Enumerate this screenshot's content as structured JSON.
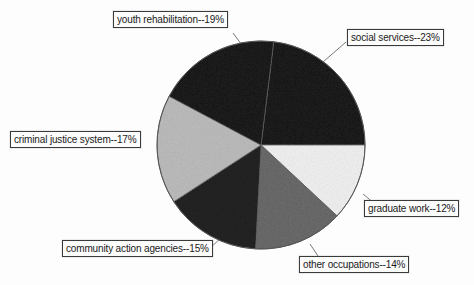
{
  "chart_data": {
    "type": "pie",
    "title": "",
    "subtitle": "",
    "xlabel": "",
    "ylabel": "",
    "legend_position": "callout-labels",
    "grid": false,
    "units": "percent",
    "total": 100,
    "categories": [
      "social services",
      "graduate work",
      "other occupations",
      "community action agencies",
      "criminal justice system",
      "youth rehabilitation"
    ],
    "values": [
      23,
      12,
      14,
      15,
      17,
      19
    ],
    "slices": [
      {
        "key": "social-services",
        "label": "social services--23%",
        "name": "social services",
        "value": 23,
        "fill": "#1c1c1c",
        "start_deg": 277,
        "end_deg": 360
      },
      {
        "key": "graduate-work",
        "label": "graduate work--12%",
        "name": "graduate work",
        "value": 12,
        "fill": "#f2f2f2",
        "start_deg": 0,
        "end_deg": 43
      },
      {
        "key": "other-occupations",
        "label": "other occupations--14%",
        "name": "other occupations",
        "value": 14,
        "fill": "#6e6e6e",
        "start_deg": 43,
        "end_deg": 93
      },
      {
        "key": "community-action-agencies",
        "label": "community action agencies--15%",
        "name": "community action agencies",
        "value": 15,
        "fill": "#242424",
        "start_deg": 93,
        "end_deg": 147
      },
      {
        "key": "criminal-justice-system",
        "label": "criminal justice system--17%",
        "name": "criminal justice system",
        "value": 17,
        "fill": "#bdbdbd",
        "start_deg": 147,
        "end_deg": 208
      },
      {
        "key": "youth-rehabilitation",
        "label": "youth rehabilitation--19%",
        "name": "youth rehabilitation",
        "value": 19,
        "fill": "#1c1c1c",
        "start_deg": 208,
        "end_deg": 277
      }
    ],
    "colors": {
      "outline": "#555555",
      "label_border": "#3a3a3a",
      "label_text": "#1a1a1a",
      "background": "#fdfdfd",
      "leader_line": "#6a6a6a"
    },
    "geometry": {
      "center_x": 261,
      "center_y": 145,
      "radius": 104
    }
  }
}
